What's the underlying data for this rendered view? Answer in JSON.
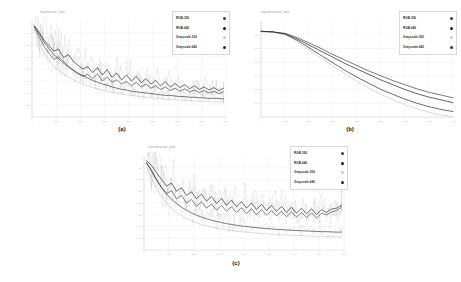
{
  "figure": {
    "background": "#ffffff",
    "panel_count": 3
  },
  "legend_series": [
    {
      "label": "RGB-300",
      "color": "#3c3c3c"
    },
    {
      "label": "RGB-640",
      "color": "#1a1a1a"
    },
    {
      "label": "Grayscale-300",
      "color": "#c8c8c8"
    },
    {
      "label": "Grayscale-640",
      "color": "#2a2a2a"
    }
  ],
  "panels": [
    {
      "caption": "(a)",
      "title": "localization_loss",
      "legend_position": "top-right"
    },
    {
      "caption": "(b)",
      "title": "regularization_loss",
      "legend_position": "top-right"
    },
    {
      "caption": "(c)",
      "title": "classification_loss",
      "legend_position": "top-right"
    }
  ],
  "chart_data": [
    {
      "type": "line",
      "title": "localization_loss",
      "panel": "(a)",
      "xlabel": "",
      "ylabel": "",
      "xlim": [
        0,
        8000
      ],
      "ylim": [
        0.0,
        0.16
      ],
      "xticks": [
        0,
        1000,
        2000,
        3000,
        4000,
        5000,
        6000,
        7000,
        8000
      ],
      "yticks": [
        0.02,
        0.04,
        0.06,
        0.08,
        0.1,
        0.12,
        0.14
      ],
      "grid": true,
      "legend": [
        "RGB-300",
        "RGB-640",
        "Grayscale-300",
        "Grayscale-640"
      ],
      "x": [
        100,
        300,
        500,
        700,
        900,
        1100,
        1300,
        1500,
        1700,
        1900,
        2100,
        2300,
        2500,
        2700,
        2900,
        3100,
        3300,
        3500,
        3700,
        3900,
        4100,
        4300,
        4500,
        4700,
        4900,
        5100,
        5300,
        5500,
        5700,
        5900,
        6100,
        6300,
        6500,
        6700,
        6900,
        7100,
        7300,
        7500,
        7700,
        7900
      ],
      "series": [
        {
          "name": "RGB-300",
          "color": "#3c3c3c",
          "values": [
            0.15,
            0.133,
            0.118,
            0.106,
            0.096,
            0.1,
            0.093,
            0.085,
            0.078,
            0.072,
            0.068,
            0.071,
            0.064,
            0.072,
            0.06,
            0.067,
            0.058,
            0.062,
            0.055,
            0.059,
            0.052,
            0.058,
            0.05,
            0.055,
            0.048,
            0.052,
            0.046,
            0.05,
            0.044,
            0.048,
            0.043,
            0.047,
            0.042,
            0.045,
            0.041,
            0.044,
            0.04,
            0.043,
            0.039,
            0.042
          ]
        },
        {
          "name": "RGB-640",
          "color": "#1a1a1a",
          "values": [
            0.152,
            0.141,
            0.128,
            0.119,
            0.11,
            0.113,
            0.099,
            0.104,
            0.093,
            0.086,
            0.08,
            0.084,
            0.074,
            0.082,
            0.07,
            0.079,
            0.066,
            0.073,
            0.062,
            0.07,
            0.06,
            0.068,
            0.057,
            0.064,
            0.055,
            0.061,
            0.052,
            0.059,
            0.05,
            0.056,
            0.049,
            0.054,
            0.047,
            0.052,
            0.046,
            0.05,
            0.045,
            0.049,
            0.044,
            0.048
          ]
        },
        {
          "name": "Grayscale-300",
          "color": "#c8c8c8",
          "values": [
            0.147,
            0.124,
            0.107,
            0.094,
            0.084,
            0.078,
            0.072,
            0.067,
            0.062,
            0.058,
            0.055,
            0.052,
            0.049,
            0.047,
            0.045,
            0.043,
            0.041,
            0.04,
            0.038,
            0.037,
            0.036,
            0.035,
            0.034,
            0.033,
            0.032,
            0.031,
            0.031,
            0.03,
            0.029,
            0.029,
            0.028,
            0.028,
            0.027,
            0.027,
            0.026,
            0.026,
            0.026,
            0.025,
            0.025,
            0.025
          ]
        },
        {
          "name": "Grayscale-640",
          "color": "#2a2a2a",
          "values": [
            0.151,
            0.138,
            0.125,
            0.114,
            0.104,
            0.097,
            0.09,
            0.083,
            0.078,
            0.073,
            0.069,
            0.065,
            0.061,
            0.058,
            0.055,
            0.053,
            0.05,
            0.048,
            0.046,
            0.045,
            0.043,
            0.042,
            0.041,
            0.04,
            0.039,
            0.038,
            0.037,
            0.036,
            0.036,
            0.035,
            0.034,
            0.034,
            0.033,
            0.033,
            0.032,
            0.032,
            0.031,
            0.031,
            0.031,
            0.03
          ]
        }
      ]
    },
    {
      "type": "line",
      "title": "regularization_loss",
      "panel": "(b)",
      "xlabel": "",
      "ylabel": "",
      "xlim": [
        0,
        8000
      ],
      "ylim": [
        0.08,
        0.22
      ],
      "xticks": [
        0,
        1000,
        2000,
        3000,
        4000,
        5000,
        6000,
        7000,
        8000
      ],
      "yticks": [
        0.1,
        0.12,
        0.14,
        0.16,
        0.18,
        0.2
      ],
      "grid": true,
      "legend": [
        "RGB-300",
        "RGB-640",
        "Grayscale-300",
        "Grayscale-640"
      ],
      "x": [
        0,
        500,
        1000,
        1500,
        2000,
        2500,
        3000,
        3500,
        4000,
        4500,
        5000,
        5500,
        6000,
        6500,
        7000,
        7500,
        8000
      ],
      "series": [
        {
          "name": "RGB-300",
          "color": "#3c3c3c",
          "values": [
            0.205,
            0.204,
            0.202,
            0.196,
            0.188,
            0.18,
            0.171,
            0.163,
            0.155,
            0.147,
            0.14,
            0.133,
            0.127,
            0.121,
            0.116,
            0.112,
            0.108
          ]
        },
        {
          "name": "RGB-640",
          "color": "#1a1a1a",
          "values": [
            0.205,
            0.204,
            0.201,
            0.194,
            0.185,
            0.176,
            0.167,
            0.158,
            0.15,
            0.142,
            0.134,
            0.127,
            0.12,
            0.114,
            0.109,
            0.105,
            0.101
          ]
        },
        {
          "name": "Grayscale-300",
          "color": "#c8c8c8",
          "values": [
            0.204,
            0.203,
            0.2,
            0.19,
            0.178,
            0.166,
            0.154,
            0.143,
            0.132,
            0.122,
            0.113,
            0.105,
            0.098,
            0.092,
            0.087,
            0.083,
            0.08
          ]
        },
        {
          "name": "Grayscale-640",
          "color": "#2a2a2a",
          "values": [
            0.205,
            0.204,
            0.201,
            0.192,
            0.181,
            0.17,
            0.159,
            0.148,
            0.138,
            0.129,
            0.12,
            0.113,
            0.106,
            0.1,
            0.095,
            0.091,
            0.088
          ]
        }
      ]
    },
    {
      "type": "line",
      "title": "classification_loss",
      "panel": "(c)",
      "xlabel": "",
      "ylabel": "",
      "xlim": [
        0,
        8000
      ],
      "ylim": [
        0.0,
        0.4
      ],
      "xticks": [
        0,
        1000,
        2000,
        3000,
        4000,
        5000,
        6000,
        7000,
        8000
      ],
      "yticks": [
        0.05,
        0.1,
        0.15,
        0.2,
        0.25,
        0.3,
        0.35
      ],
      "grid": true,
      "legend": [
        "RGB-300",
        "RGB-640",
        "Grayscale-300",
        "Grayscale-640"
      ],
      "x": [
        100,
        300,
        500,
        700,
        900,
        1100,
        1300,
        1500,
        1700,
        1900,
        2100,
        2300,
        2500,
        2700,
        2900,
        3100,
        3300,
        3500,
        3700,
        3900,
        4100,
        4300,
        4500,
        4700,
        4900,
        5100,
        5300,
        5500,
        5700,
        5900,
        6100,
        6300,
        6500,
        6700,
        6900,
        7100,
        7300,
        7500,
        7700,
        7900
      ],
      "series": [
        {
          "name": "RGB-300",
          "color": "#3c3c3c",
          "values": [
            0.37,
            0.34,
            0.3,
            0.268,
            0.24,
            0.252,
            0.218,
            0.232,
            0.2,
            0.215,
            0.186,
            0.205,
            0.178,
            0.196,
            0.17,
            0.19,
            0.165,
            0.184,
            0.16,
            0.18,
            0.155,
            0.176,
            0.15,
            0.172,
            0.148,
            0.168,
            0.145,
            0.165,
            0.142,
            0.162,
            0.14,
            0.16,
            0.138,
            0.158,
            0.136,
            0.156,
            0.15,
            0.162,
            0.168,
            0.182
          ]
        },
        {
          "name": "RGB-640",
          "color": "#1a1a1a",
          "values": [
            0.38,
            0.36,
            0.33,
            0.3,
            0.272,
            0.285,
            0.25,
            0.265,
            0.232,
            0.248,
            0.218,
            0.238,
            0.208,
            0.228,
            0.198,
            0.22,
            0.19,
            0.212,
            0.184,
            0.206,
            0.178,
            0.2,
            0.172,
            0.195,
            0.168,
            0.19,
            0.164,
            0.186,
            0.16,
            0.182,
            0.157,
            0.178,
            0.154,
            0.175,
            0.151,
            0.172,
            0.16,
            0.174,
            0.178,
            0.19
          ]
        },
        {
          "name": "Grayscale-300",
          "color": "#c8c8c8",
          "values": [
            0.355,
            0.305,
            0.262,
            0.228,
            0.2,
            0.178,
            0.16,
            0.146,
            0.134,
            0.124,
            0.116,
            0.109,
            0.103,
            0.098,
            0.093,
            0.089,
            0.086,
            0.083,
            0.08,
            0.078,
            0.076,
            0.074,
            0.072,
            0.07,
            0.069,
            0.067,
            0.066,
            0.065,
            0.064,
            0.063,
            0.062,
            0.061,
            0.06,
            0.059,
            0.058,
            0.058,
            0.057,
            0.056,
            0.056,
            0.055
          ]
        },
        {
          "name": "Grayscale-640",
          "color": "#2a2a2a",
          "values": [
            0.372,
            0.335,
            0.298,
            0.265,
            0.238,
            0.216,
            0.198,
            0.182,
            0.169,
            0.158,
            0.148,
            0.14,
            0.133,
            0.127,
            0.121,
            0.117,
            0.112,
            0.109,
            0.105,
            0.102,
            0.1,
            0.097,
            0.095,
            0.093,
            0.091,
            0.09,
            0.088,
            0.087,
            0.085,
            0.084,
            0.083,
            0.082,
            0.081,
            0.08,
            0.079,
            0.078,
            0.078,
            0.077,
            0.076,
            0.076
          ]
        }
      ]
    }
  ]
}
